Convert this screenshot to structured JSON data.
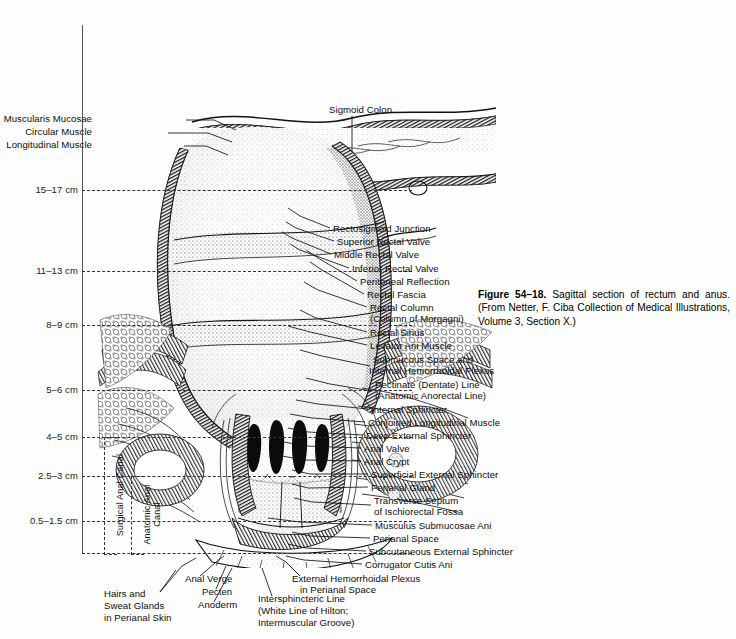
{
  "figure": {
    "caption_bold": "Figure 54–18.",
    "caption_text": " Sagittal section of rectum and anus. (From Netter, F. Ciba Collection of Medical Illustrations, Volume 3, Section X.)",
    "background_color": "#fdfdfd",
    "ink_color": "#0d0d0d"
  },
  "scale": {
    "unit": "cm",
    "marks": [
      {
        "label": "15–17 cm",
        "y": 190
      },
      {
        "label": "11–13 cm",
        "y": 271
      },
      {
        "label": "8–9 cm",
        "y": 325
      },
      {
        "label": "5–6 cm",
        "y": 390
      },
      {
        "label": "4–5 cm",
        "y": 437
      },
      {
        "label": "2.5–3 cm",
        "y": 476
      },
      {
        "label": "0.5–1.5 cm",
        "y": 521
      }
    ]
  },
  "brackets": [
    {
      "label": "Surgical Anal Canal",
      "top": 437,
      "bottom": 553
    },
    {
      "label": "Anatomic Anal Canal",
      "top": 476,
      "bottom": 553
    }
  ],
  "labels_left": [
    {
      "text": "Muscularis Mucosae",
      "x": 92,
      "y": 120
    },
    {
      "text": "Circular Muscle",
      "x": 92,
      "y": 133
    },
    {
      "text": "Longitudinal Muscle",
      "x": 92,
      "y": 146
    }
  ],
  "labels_top": [
    {
      "text": "Sigmoid Colon",
      "x": 329,
      "y": 111
    }
  ],
  "labels_right": [
    {
      "text": "Rectosigmoid Junction",
      "x": 333,
      "y": 230
    },
    {
      "text": "Superior Rectal Valve",
      "x": 337,
      "y": 243
    },
    {
      "text": "Middle Rectal Valve",
      "x": 334,
      "y": 256
    },
    {
      "text": "Inferior Rectal Valve",
      "x": 352,
      "y": 270
    },
    {
      "text": "Peritoneal Reflection",
      "x": 360,
      "y": 283
    },
    {
      "text": "Rectal Fascia",
      "x": 367,
      "y": 296
    },
    {
      "text": "Rectal Column",
      "x": 370,
      "y": 309
    },
    {
      "text": "(Column of Morgagni)",
      "x": 370,
      "y": 320
    },
    {
      "text": "Rectal Sinus",
      "x": 370,
      "y": 334
    },
    {
      "text": "Levator Ani Muscle",
      "x": 370,
      "y": 347
    },
    {
      "text": "Submucous Space and",
      "x": 373,
      "y": 361
    },
    {
      "text": "Internal Hemorrhoidal Plexus",
      "x": 369,
      "y": 372
    },
    {
      "text": "Pectinate (Dentate) Line",
      "x": 375,
      "y": 386
    },
    {
      "text": "(Anatomic Anorectal Line)",
      "x": 375,
      "y": 397
    },
    {
      "text": "Internal Sphincter",
      "x": 371,
      "y": 411
    },
    {
      "text": "Conjoined Longitudinal Muscle",
      "x": 368,
      "y": 424
    },
    {
      "text": "Deep External Sphincter",
      "x": 366,
      "y": 437
    },
    {
      "text": "Anal Valve",
      "x": 364,
      "y": 450
    },
    {
      "text": "Anal Crypt",
      "x": 364,
      "y": 463
    },
    {
      "text": "Superficial External Sphincter",
      "x": 371,
      "y": 476
    },
    {
      "text": "Perianal Gland",
      "x": 371,
      "y": 489
    },
    {
      "text": "Transverse Septum",
      "x": 374,
      "y": 502
    },
    {
      "text": "of Ischiorectal Fossa",
      "x": 374,
      "y": 513
    },
    {
      "text": "Musculus Submucosae Ani",
      "x": 375,
      "y": 527
    },
    {
      "text": "Perianal Space",
      "x": 373,
      "y": 540
    },
    {
      "text": "Subcutaneous External Sphincter",
      "x": 369,
      "y": 553
    },
    {
      "text": "Corrugator Cutis Ani",
      "x": 365,
      "y": 566
    }
  ],
  "labels_bottom": [
    {
      "text": "External Hemorrhoidal Plexus",
      "x": 292,
      "y": 580
    },
    {
      "text": "in Perianal Space",
      "x": 300,
      "y": 591
    },
    {
      "text": "Anal Verge",
      "x": 185,
      "y": 580
    },
    {
      "text": "Pecten",
      "x": 202,
      "y": 593
    },
    {
      "text": "Anoderm",
      "x": 198,
      "y": 606
    },
    {
      "text": "Hairs and",
      "x": 104,
      "y": 595
    },
    {
      "text": "Sweat Glands",
      "x": 104,
      "y": 607
    },
    {
      "text": "in Perianal Skin",
      "x": 104,
      "y": 619
    },
    {
      "text": "Intersphincteric Line",
      "x": 258,
      "y": 600
    },
    {
      "text": "(White Line of Hilton;",
      "x": 258,
      "y": 612
    },
    {
      "text": "Intermuscular Groove)",
      "x": 258,
      "y": 624
    }
  ]
}
